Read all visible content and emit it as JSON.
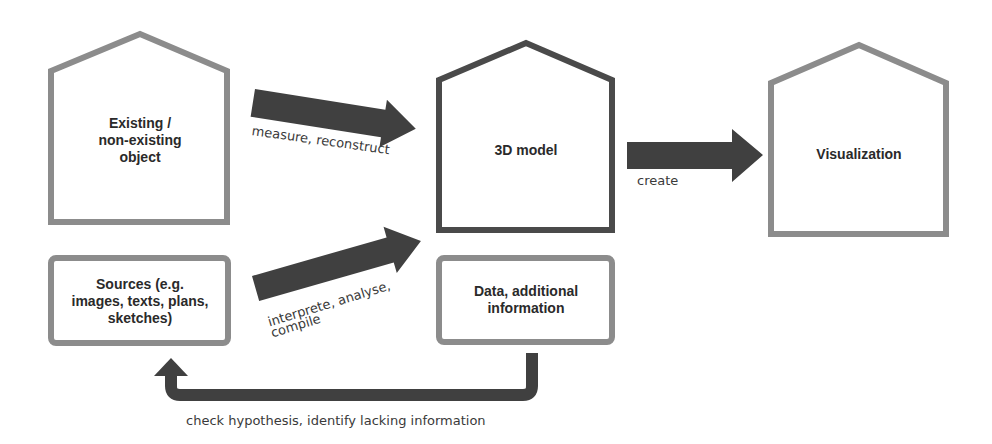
{
  "diagram": {
    "type": "flow",
    "colors": {
      "light_stroke": "#8c8c8c",
      "dark_stroke": "#4a4a4a",
      "arrow_fill": "#404040",
      "text": "#2a2a2a",
      "background": "#ffffff"
    },
    "nodes": {
      "object": {
        "label": "Existing /\nnon-existing\nobject",
        "shape": "house"
      },
      "sources": {
        "label": "Sources (e.g.\nimages, texts, plans,\nsketches)",
        "shape": "rounded-box"
      },
      "model": {
        "label": "3D model",
        "shape": "house"
      },
      "data": {
        "label": "Data, additional\ninformation",
        "shape": "rounded-box"
      },
      "visualization": {
        "label": "Visualization",
        "shape": "house"
      }
    },
    "edges": {
      "measure": {
        "from": "object",
        "to": "model",
        "label": "measure, reconstruct"
      },
      "interpret": {
        "from": "sources",
        "to": "model",
        "label_line1": "interprete, analyse,",
        "label_line2": "compile"
      },
      "create": {
        "from": "model",
        "to": "visualization",
        "label": "create"
      },
      "feedback": {
        "from": "data",
        "to": "sources",
        "label": "check hypothesis, identify lacking information"
      }
    }
  }
}
